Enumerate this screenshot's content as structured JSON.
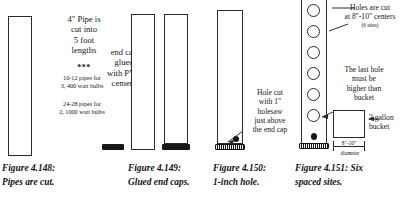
{
  "figure_group": {
    "panels": [
      {
        "id": "panel-pipes-cut",
        "annotation_main": [
          "4\" Pipe is",
          "cut into",
          "5  foot",
          "lengths"
        ],
        "separator": "***",
        "annotation_notes": [
          [
            "10-12 pipes for",
            "3, 400 watt bulbs"
          ],
          [
            "24-28 pipes for",
            "2, 1000 watt bulbs"
          ]
        ],
        "caption_lines": [
          "Figure 4.148:",
          "Pipes are cut."
        ]
      },
      {
        "id": "panel-glued-end-caps",
        "annotation_main": [
          "end cap",
          "glued",
          "with PVC",
          "cement"
        ],
        "caption_lines": [
          "Figure 4.149:",
          "Glued end caps."
        ]
      },
      {
        "id": "panel-one-inch-hole",
        "annotation_main": [
          "Hole cut",
          "with 1\"",
          "holesaw",
          "just above",
          "the end cap"
        ],
        "caption_lines": [
          "Figure 4.150:",
          "1-inch hole."
        ]
      },
      {
        "id": "panel-six-spaced-sites",
        "annotation_holes": [
          "Holes are cut",
          "at 8\"-10\" centers"
        ],
        "annotation_holes_note": "(6 sites)",
        "annotation_last_hole": [
          "The last hole",
          "must be",
          "higher than",
          "bucket"
        ],
        "bucket_label": [
          "3 gallon",
          "bucket"
        ],
        "dimension_value": "8\"-10\"",
        "dimension_label": "diameter",
        "hole_count": 6,
        "caption_lines": [
          "Figure 4.151: Six",
          "spaced sites."
        ]
      }
    ]
  },
  "colors": {
    "ink": "#161616",
    "line": "#2b2b2b",
    "cap_fill": "#181818",
    "paper": "#ffffff"
  }
}
